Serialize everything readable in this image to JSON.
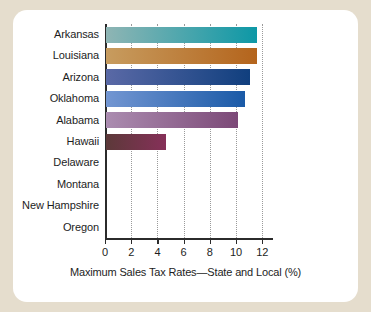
{
  "figure": {
    "background_color": "#ffffff",
    "page_background_color": "#e5ddcd"
  },
  "chart_data": {
    "type": "bar",
    "orientation": "horizontal",
    "title": "",
    "xlabel": "Maximum Sales Tax Rates—State and Local (%)",
    "ylabel": "",
    "xlim": [
      0,
      12.8
    ],
    "xticks": [
      0,
      2,
      4,
      6,
      8,
      10,
      12
    ],
    "xticklabels": [
      "0",
      "2",
      "4",
      "6",
      "8",
      "10",
      "12"
    ],
    "grid": "vertical-dotted",
    "legend": "none",
    "categories": [
      "Arkansas",
      "Louisiana",
      "Arizona",
      "Oklahoma",
      "Alabama",
      "Hawaii",
      "Delaware",
      "Montana",
      "New Hampshire",
      "Oregon"
    ],
    "values": [
      11.5,
      11.5,
      11.0,
      10.6,
      10.1,
      4.6,
      0,
      0,
      0,
      0
    ],
    "bar_colors": [
      {
        "from": "#8fb5b4",
        "to": "#0d98a6"
      },
      {
        "from": "#c79c5f",
        "to": "#b4641c"
      },
      {
        "from": "#5a69a6",
        "to": "#103f7e"
      },
      {
        "from": "#7396d2",
        "to": "#1a5aa7"
      },
      {
        "from": "#ab8cb0",
        "to": "#7c4977"
      },
      {
        "from": "#5c3939",
        "to": "#863059"
      },
      {
        "from": "#ffffff",
        "to": "#ffffff"
      },
      {
        "from": "#ffffff",
        "to": "#ffffff"
      },
      {
        "from": "#ffffff",
        "to": "#ffffff"
      },
      {
        "from": "#ffffff",
        "to": "#ffffff"
      }
    ]
  }
}
